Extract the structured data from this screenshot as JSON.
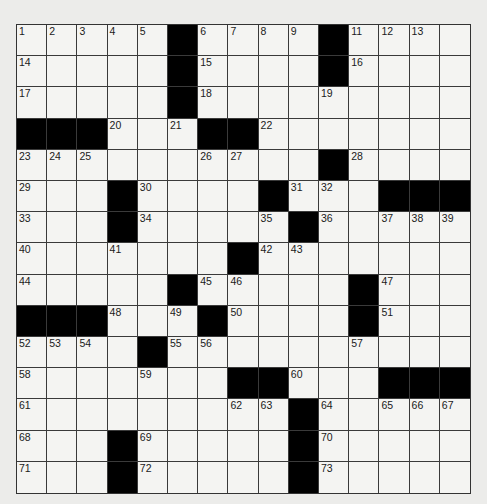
{
  "puzzle": {
    "rows": 15,
    "cols": 15,
    "colors": {
      "background": "#ececea",
      "cell": "#f4f4f2",
      "block": "#000000",
      "gridline": "#3a3a3a",
      "number": "#1a1a1a"
    },
    "blocks": [
      [
        0,
        5
      ],
      [
        0,
        10
      ],
      [
        1,
        5
      ],
      [
        1,
        10
      ],
      [
        2,
        5
      ],
      [
        3,
        0
      ],
      [
        3,
        1
      ],
      [
        3,
        2
      ],
      [
        3,
        6
      ],
      [
        3,
        7
      ],
      [
        4,
        10
      ],
      [
        5,
        3
      ],
      [
        5,
        8
      ],
      [
        5,
        12
      ],
      [
        5,
        13
      ],
      [
        5,
        14
      ],
      [
        6,
        3
      ],
      [
        6,
        9
      ],
      [
        7,
        7
      ],
      [
        8,
        5
      ],
      [
        8,
        11
      ],
      [
        9,
        0
      ],
      [
        9,
        1
      ],
      [
        9,
        2
      ],
      [
        9,
        6
      ],
      [
        9,
        11
      ],
      [
        10,
        4
      ],
      [
        11,
        7
      ],
      [
        11,
        8
      ],
      [
        11,
        12
      ],
      [
        11,
        13
      ],
      [
        11,
        14
      ],
      [
        12,
        9
      ],
      [
        13,
        3
      ],
      [
        13,
        9
      ],
      [
        14,
        3
      ],
      [
        14,
        9
      ]
    ],
    "numbers": [
      {
        "n": "1",
        "r": 0,
        "c": 0
      },
      {
        "n": "2",
        "r": 0,
        "c": 1
      },
      {
        "n": "3",
        "r": 0,
        "c": 2
      },
      {
        "n": "4",
        "r": 0,
        "c": 3
      },
      {
        "n": "5",
        "r": 0,
        "c": 4
      },
      {
        "n": "6",
        "r": 0,
        "c": 6
      },
      {
        "n": "7",
        "r": 0,
        "c": 7
      },
      {
        "n": "8",
        "r": 0,
        "c": 8
      },
      {
        "n": "9",
        "r": 0,
        "c": 9
      },
      {
        "n": "10",
        "r": 0,
        "c": 10
      },
      {
        "n": "11",
        "r": 0,
        "c": 11
      },
      {
        "n": "12",
        "r": 0,
        "c": 12
      },
      {
        "n": "13",
        "r": 0,
        "c": 13
      },
      {
        "n": "14",
        "r": 1,
        "c": 0
      },
      {
        "n": "15",
        "r": 1,
        "c": 6
      },
      {
        "n": "16",
        "r": 1,
        "c": 11
      },
      {
        "n": "17",
        "r": 2,
        "c": 0
      },
      {
        "n": "18",
        "r": 2,
        "c": 6
      },
      {
        "n": "19",
        "r": 2,
        "c": 10
      },
      {
        "n": "20",
        "r": 3,
        "c": 3
      },
      {
        "n": "21",
        "r": 3,
        "c": 5
      },
      {
        "n": "22",
        "r": 3,
        "c": 8
      },
      {
        "n": "23",
        "r": 4,
        "c": 0
      },
      {
        "n": "24",
        "r": 4,
        "c": 1
      },
      {
        "n": "25",
        "r": 4,
        "c": 2
      },
      {
        "n": "26",
        "r": 4,
        "c": 6
      },
      {
        "n": "27",
        "r": 4,
        "c": 7
      },
      {
        "n": "28",
        "r": 4,
        "c": 11
      },
      {
        "n": "29",
        "r": 5,
        "c": 0
      },
      {
        "n": "30",
        "r": 5,
        "c": 4
      },
      {
        "n": "31",
        "r": 5,
        "c": 9
      },
      {
        "n": "32",
        "r": 5,
        "c": 10
      },
      {
        "n": "33",
        "r": 6,
        "c": 0
      },
      {
        "n": "34",
        "r": 6,
        "c": 4
      },
      {
        "n": "35",
        "r": 6,
        "c": 8
      },
      {
        "n": "36",
        "r": 6,
        "c": 10
      },
      {
        "n": "37",
        "r": 6,
        "c": 12
      },
      {
        "n": "38",
        "r": 6,
        "c": 13
      },
      {
        "n": "39",
        "r": 6,
        "c": 14
      },
      {
        "n": "40",
        "r": 7,
        "c": 0
      },
      {
        "n": "41",
        "r": 7,
        "c": 3
      },
      {
        "n": "42",
        "r": 7,
        "c": 8
      },
      {
        "n": "43",
        "r": 7,
        "c": 9
      },
      {
        "n": "44",
        "r": 8,
        "c": 0
      },
      {
        "n": "45",
        "r": 8,
        "c": 6
      },
      {
        "n": "46",
        "r": 8,
        "c": 7
      },
      {
        "n": "47",
        "r": 8,
        "c": 12
      },
      {
        "n": "48",
        "r": 9,
        "c": 3
      },
      {
        "n": "49",
        "r": 9,
        "c": 5
      },
      {
        "n": "50",
        "r": 9,
        "c": 7
      },
      {
        "n": "51",
        "r": 9,
        "c": 12
      },
      {
        "n": "52",
        "r": 10,
        "c": 0
      },
      {
        "n": "53",
        "r": 10,
        "c": 1
      },
      {
        "n": "54",
        "r": 10,
        "c": 2
      },
      {
        "n": "55",
        "r": 10,
        "c": 5
      },
      {
        "n": "56",
        "r": 10,
        "c": 6
      },
      {
        "n": "57",
        "r": 10,
        "c": 11
      },
      {
        "n": "58",
        "r": 11,
        "c": 0
      },
      {
        "n": "59",
        "r": 11,
        "c": 4
      },
      {
        "n": "60",
        "r": 11,
        "c": 9
      },
      {
        "n": "61",
        "r": 12,
        "c": 0
      },
      {
        "n": "62",
        "r": 12,
        "c": 7
      },
      {
        "n": "63",
        "r": 12,
        "c": 8
      },
      {
        "n": "64",
        "r": 12,
        "c": 10
      },
      {
        "n": "65",
        "r": 12,
        "c": 12
      },
      {
        "n": "66",
        "r": 12,
        "c": 13
      },
      {
        "n": "67",
        "r": 12,
        "c": 14
      },
      {
        "n": "68",
        "r": 13,
        "c": 0
      },
      {
        "n": "69",
        "r": 13,
        "c": 4
      },
      {
        "n": "70",
        "r": 13,
        "c": 10
      },
      {
        "n": "71",
        "r": 14,
        "c": 0
      },
      {
        "n": "72",
        "r": 14,
        "c": 4
      },
      {
        "n": "73",
        "r": 14,
        "c": 10
      }
    ]
  }
}
